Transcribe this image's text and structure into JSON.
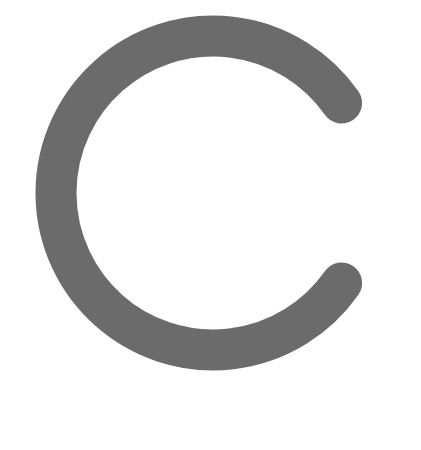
{
  "figure": {
    "shape": "letter-c-arc",
    "glyph": "C",
    "colors": {
      "stroke": "#6b6b6b",
      "background": "#ffffff"
    },
    "geometry": {
      "center_x": 213,
      "center_y": 193,
      "radius": 157,
      "stroke_width": 41,
      "gap_half_angle_deg": 35
    }
  }
}
